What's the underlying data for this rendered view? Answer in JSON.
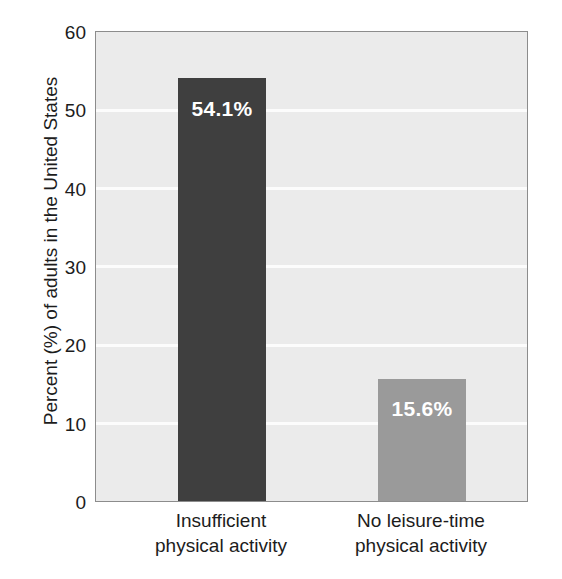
{
  "chart_data": {
    "type": "bar",
    "title": "",
    "xlabel": "",
    "ylabel": "Percent (%) of adults in the United States",
    "ylim": [
      0,
      60
    ],
    "yticks": [
      0,
      10,
      20,
      30,
      40,
      50,
      60
    ],
    "ytick_labels": [
      "0",
      "10",
      "20",
      "30",
      "40",
      "50",
      "60"
    ],
    "grid": true,
    "grid_orientation": "horizontal",
    "legend": "none",
    "categories": [
      "Insufficient physical activity",
      "No leisure-time physical activity"
    ],
    "category_lines": [
      [
        "Insufficient",
        "physical activity"
      ],
      [
        "No leisure-time",
        "physical activity"
      ]
    ],
    "values": [
      54.1,
      15.6
    ],
    "value_labels": [
      "54.1%",
      "15.6%"
    ],
    "bar_colors": [
      "#3f3f3f",
      "#9a9a9a"
    ],
    "plot_background": "#ebebeb",
    "grid_color": "#fcfcfc",
    "axis_color": "#8c8c8c",
    "text_color": "#1c1c1c",
    "value_label_color": "#ffffff"
  }
}
